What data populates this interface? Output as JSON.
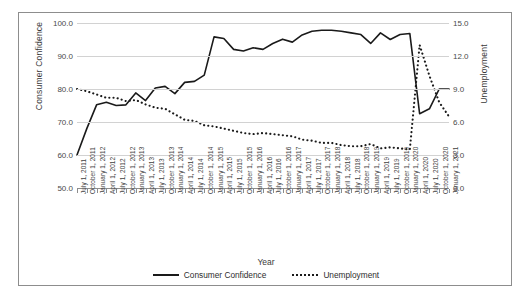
{
  "figure": {
    "clipped_header_text": "",
    "xaxis_title": "Year"
  },
  "legend": {
    "items": [
      {
        "label": "Consumer Confidence",
        "style": "solid"
      },
      {
        "label": "Unemployment",
        "style": "dotted"
      }
    ]
  },
  "chart_data": {
    "type": "line",
    "title": "",
    "xlabel": "Year",
    "grid": "horizontal",
    "legend_position": "bottom",
    "axes": {
      "left": {
        "label": "Consumer Confidence",
        "ylim": [
          50.0,
          100.0
        ],
        "ticks": [
          "50.0",
          "60.0",
          "70.0",
          "80.0",
          "90.0",
          "100.0"
        ],
        "tick_values": [
          50.0,
          60.0,
          70.0,
          80.0,
          90.0,
          100.0
        ]
      },
      "right": {
        "label": "Unemployment",
        "ylim": [
          0.0,
          15.0
        ],
        "ticks": [
          "0.0",
          "3.0",
          "6.0",
          "9.0",
          "12.0",
          "15.0"
        ],
        "tick_values": [
          0.0,
          3.0,
          6.0,
          9.0,
          12.0,
          15.0
        ]
      }
    },
    "categories": [
      "July 1, 2011",
      "October 1, 2011",
      "January 1, 2012",
      "April 1, 2012",
      "July 1, 2012",
      "October 1, 2012",
      "January 1, 2013",
      "April 1, 2013",
      "July 1, 2013",
      "October 1, 2013",
      "January 1, 2014",
      "April 1, 2014",
      "July 1, 2014",
      "October 1, 2014",
      "January 1, 2015",
      "April 1, 2015",
      "July 1, 2015",
      "October 1, 2015",
      "January 1, 2016",
      "April 1, 2016",
      "July 1, 2016",
      "October 1, 2016",
      "January 1, 2017",
      "April 1, 2017",
      "July 1, 2017",
      "October 1, 2017",
      "January 1, 2018",
      "April 1, 2018",
      "July 1, 2018",
      "October 1, 2018",
      "January 1, 2019",
      "April 1, 2019",
      "July 1, 2019",
      "October 1, 2019",
      "January 1, 2020",
      "April 1, 2020",
      "July 1, 2020",
      "October 1, 2020",
      "January 1, 2021"
    ],
    "series": [
      {
        "name": "Consumer Confidence",
        "axis": "left",
        "style": "solid",
        "values": [
          60.0,
          68.0,
          75.2,
          76.0,
          75.0,
          75.2,
          78.8,
          76.5,
          80.3,
          80.8,
          78.6,
          82.0,
          82.3,
          84.2,
          95.8,
          95.3,
          92.0,
          91.5,
          92.5,
          92.0,
          93.8,
          95.1,
          94.2,
          96.4,
          97.5,
          97.8,
          97.8,
          97.5,
          97.0,
          96.5,
          93.8,
          97.0,
          95.0,
          96.5,
          96.8,
          72.5,
          74.0,
          80.0,
          80.0
        ]
      },
      {
        "name": "Unemployment",
        "axis": "right",
        "style": "dotted",
        "values": [
          9.0,
          8.8,
          8.5,
          8.2,
          8.2,
          7.9,
          8.0,
          7.6,
          7.3,
          7.2,
          6.7,
          6.2,
          6.1,
          5.7,
          5.6,
          5.4,
          5.2,
          5.0,
          4.9,
          5.0,
          4.9,
          4.8,
          4.7,
          4.4,
          4.3,
          4.1,
          4.1,
          3.9,
          3.8,
          3.8,
          4.0,
          3.6,
          3.7,
          3.6,
          3.5,
          13.0,
          10.2,
          7.8,
          6.5
        ]
      }
    ]
  }
}
